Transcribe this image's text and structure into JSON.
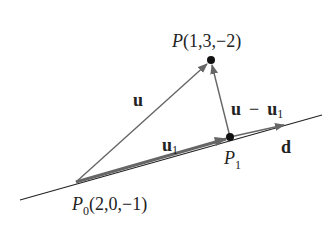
{
  "diagram": {
    "colors": {
      "line": "#222222",
      "vector": "#666666",
      "point": "#111111",
      "text": "#222222"
    },
    "points": {
      "P": {
        "name": "P",
        "coords": "(1,3,−2)",
        "x": 211,
        "y": 60
      },
      "P1": {
        "name": "P",
        "sub": "1",
        "x": 230,
        "y": 137
      },
      "P0": {
        "name": "P",
        "sub": "0",
        "coords": "(2,0,−1)",
        "x": 76,
        "y": 182
      }
    },
    "labels": {
      "u": "u",
      "u1_main": "u",
      "u1_sub": "1",
      "diff_u": "u",
      "diff_minus": "−",
      "diff_u1": "u",
      "diff_u1_sub": "1",
      "d": "d"
    }
  }
}
